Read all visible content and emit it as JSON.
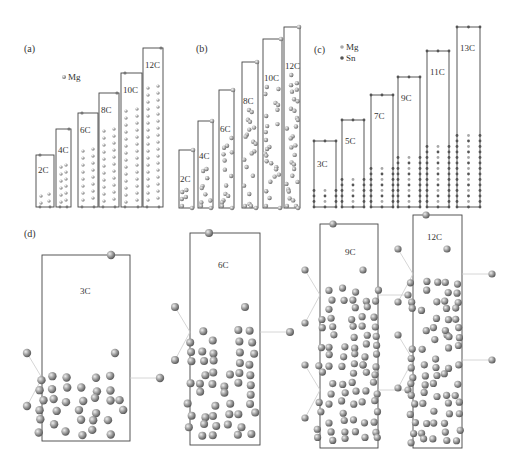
{
  "figure": {
    "panels": [
      {
        "id": "a",
        "label": "(a)",
        "legend": [
          {
            "symbol": "dot-mg",
            "text": "Mg"
          }
        ],
        "cells": [
          {
            "label": "2C"
          },
          {
            "label": "4C"
          },
          {
            "label": "6C"
          },
          {
            "label": "8C"
          },
          {
            "label": "10C"
          },
          {
            "label": "12C"
          }
        ]
      },
      {
        "id": "b",
        "label": "(b)",
        "cells": [
          {
            "label": "2C"
          },
          {
            "label": "4C"
          },
          {
            "label": "6C"
          },
          {
            "label": "8C"
          },
          {
            "label": "10C"
          },
          {
            "label": "12C"
          }
        ]
      },
      {
        "id": "c",
        "label": "(c)",
        "legend": [
          {
            "symbol": "dot-mg",
            "text": "Mg"
          },
          {
            "symbol": "dot-sn",
            "text": "Sn"
          }
        ],
        "cells": [
          {
            "label": "3C"
          },
          {
            "label": "5C"
          },
          {
            "label": "7C"
          },
          {
            "label": "9C"
          },
          {
            "label": "11C"
          },
          {
            "label": "13C"
          }
        ]
      },
      {
        "id": "d",
        "label": "(d)",
        "cells": [
          {
            "label": "3C"
          },
          {
            "label": "6C"
          },
          {
            "label": "9C"
          },
          {
            "label": "12C"
          }
        ]
      }
    ],
    "colors": {
      "mg_atom": "#a8a8a8",
      "sn_atom": "#555555",
      "cell_border": "#444444",
      "bond": "#cccccc"
    }
  }
}
